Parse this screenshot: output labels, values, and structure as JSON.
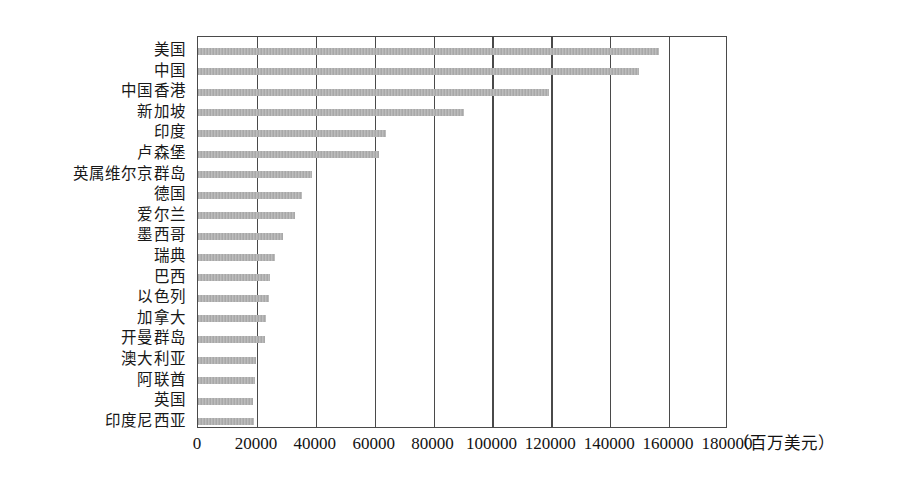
{
  "chart_data": {
    "type": "bar",
    "orientation": "horizontal",
    "title": "",
    "xlabel": "（百万美元）",
    "ylabel": "",
    "xlim": [
      0,
      180000
    ],
    "xticks": [
      "0",
      "20000",
      "40000",
      "60000",
      "80000",
      "100000",
      "120000",
      "140000",
      "160000",
      "180000"
    ],
    "xtick_values": [
      0,
      20000,
      40000,
      60000,
      80000,
      100000,
      120000,
      140000,
      160000,
      180000
    ],
    "grid": true,
    "legend": "none",
    "bar_color": "#b3b3b3",
    "axis_color": "#4a4a4a",
    "categories": [
      "美国",
      "中国",
      "中国香港",
      "新加坡",
      "印度",
      "卢森堡",
      "英属维尔京群岛",
      "德国",
      "爱尔兰",
      "墨西哥",
      "瑞典",
      "巴西",
      "以色列",
      "加拿大",
      "开曼群岛",
      "澳大利亚",
      "阿联酋",
      "英国",
      "印度尼西亚"
    ],
    "values": [
      156700,
      149800,
      119300,
      90400,
      63900,
      61500,
      38700,
      35300,
      33000,
      28900,
      26200,
      24500,
      24100,
      23100,
      22800,
      19700,
      19400,
      18700,
      19000
    ]
  }
}
